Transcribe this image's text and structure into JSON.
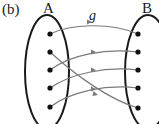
{
  "figure": {
    "part_label": "(b)",
    "set_a_label": "A",
    "set_b_label": "B",
    "function_label": "g"
  },
  "colors": {
    "ink": "#1a1a1a",
    "arrow": "#7a7a7a"
  },
  "set_a": {
    "element_count": 5
  },
  "set_b": {
    "element_count": 5
  },
  "mapping": [
    {
      "from": 1,
      "to": 1
    },
    {
      "from": 2,
      "to": 5
    },
    {
      "from": 3,
      "to": 2
    },
    {
      "from": 4,
      "to": 3
    },
    {
      "from": 5,
      "to": 4
    }
  ]
}
